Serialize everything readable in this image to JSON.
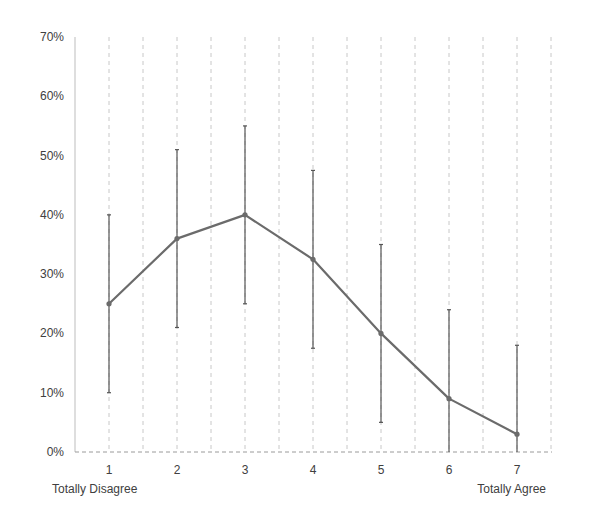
{
  "chart_data": {
    "type": "line",
    "title": "",
    "xlabel": "",
    "ylabel": "",
    "categories": [
      "1",
      "2",
      "3",
      "4",
      "5",
      "6",
      "7"
    ],
    "category_notes": {
      "first": "Totally Disagree",
      "last": "Totally Agree"
    },
    "series": [
      {
        "name": "Response share",
        "values": [
          25,
          36,
          40,
          32.5,
          20,
          9,
          3
        ],
        "error_plus": [
          15,
          15,
          15,
          15,
          15,
          15,
          15
        ],
        "error_minus": [
          15,
          15,
          15,
          15,
          15,
          9,
          3
        ],
        "color": "#6b6b6b"
      }
    ],
    "ylim": [
      0,
      70
    ],
    "yticks": [
      0,
      10,
      20,
      30,
      40,
      50,
      60,
      70
    ],
    "ytick_labels": [
      "0%",
      "10%",
      "20%",
      "30%",
      "40%",
      "50%",
      "60%",
      "70%"
    ],
    "grid": "vertical dashed",
    "legend": "none"
  },
  "colors": {
    "line": "#6b6b6b",
    "error_bar": "#555555",
    "grid": "#c8c8c8",
    "axis": "#bdbdbd",
    "text": "#404040"
  }
}
